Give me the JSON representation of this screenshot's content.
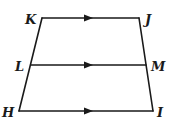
{
  "diagram": {
    "type": "trapezoid-with-midsegment",
    "points": {
      "K": {
        "label": "K",
        "x": 42,
        "y": 18,
        "lx": 25,
        "ly": 24
      },
      "J": {
        "label": "J",
        "x": 139,
        "y": 18,
        "lx": 145,
        "ly": 24
      },
      "L": {
        "label": "L",
        "x": 31,
        "y": 65,
        "lx": 15,
        "ly": 71
      },
      "M": {
        "label": "M",
        "x": 146,
        "y": 65,
        "lx": 151,
        "ly": 71
      },
      "H": {
        "label": "H",
        "x": 19,
        "y": 111,
        "lx": 2,
        "ly": 117
      },
      "I": {
        "label": "I",
        "x": 153,
        "y": 111,
        "lx": 157,
        "ly": 117
      }
    },
    "segments": [
      {
        "from": "K",
        "to": "J",
        "parallel_arrow": true
      },
      {
        "from": "L",
        "to": "M",
        "parallel_arrow": true
      },
      {
        "from": "H",
        "to": "I",
        "parallel_arrow": true
      },
      {
        "from": "K",
        "to": "H",
        "parallel_arrow": false
      },
      {
        "from": "J",
        "to": "I",
        "parallel_arrow": false
      }
    ],
    "arrow_x": 89,
    "colors": {
      "stroke": "#1a1a1a",
      "background": "#ffffff"
    }
  }
}
